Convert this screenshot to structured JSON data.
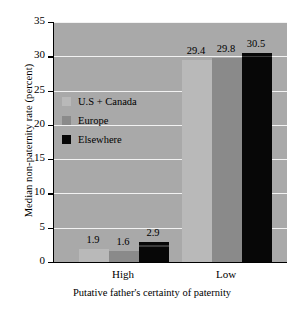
{
  "chart_data": {
    "type": "bar",
    "title": "",
    "xlabel": "Putative father's certainty of paternity",
    "ylabel": "Median non-paternity rate (percent)",
    "categories": [
      "High",
      "Low"
    ],
    "series": [
      {
        "name": "U.S + Canada",
        "color": "#b9b9b9",
        "values": [
          1.9,
          29.4
        ]
      },
      {
        "name": "Europe",
        "color": "#8a8a8a",
        "values": [
          1.6,
          29.8
        ]
      },
      {
        "name": "Elsewhere",
        "color": "#070707",
        "values": [
          2.9,
          30.5
        ]
      }
    ],
    "ylim": [
      0,
      35
    ],
    "yticks": [
      "0",
      "5",
      "10",
      "15",
      "20",
      "25",
      "30",
      "35"
    ],
    "ytick_values": [
      0,
      5,
      10,
      15,
      20,
      25,
      30,
      35
    ],
    "grid": true,
    "grid_color": "#f2f2f2",
    "plot_background": "#a9a9a9",
    "legend_position": "upper left",
    "value_labels": [
      {
        "category": "High",
        "series": "U.S + Canada",
        "text": "1.9"
      },
      {
        "category": "High",
        "series": "Europe",
        "text": "1.6"
      },
      {
        "category": "High",
        "series": "Elsewhere",
        "text": "2.9"
      },
      {
        "category": "Low",
        "series": "U.S + Canada",
        "text": "29.4"
      },
      {
        "category": "Low",
        "series": "Europe",
        "text": "29.8"
      },
      {
        "category": "Low",
        "series": "Elsewhere",
        "text": "30.5"
      }
    ]
  }
}
